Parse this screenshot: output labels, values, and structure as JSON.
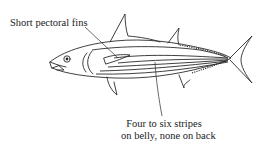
{
  "figure": {
    "callouts": [
      {
        "id": "pectoral",
        "text": "Short pectoral fins"
      },
      {
        "id": "stripes",
        "lines": [
          "Four to six stripes",
          "on belly, none on back"
        ]
      }
    ],
    "colors": {
      "background": "#ffffff",
      "ink": "#2a2a2a"
    }
  }
}
